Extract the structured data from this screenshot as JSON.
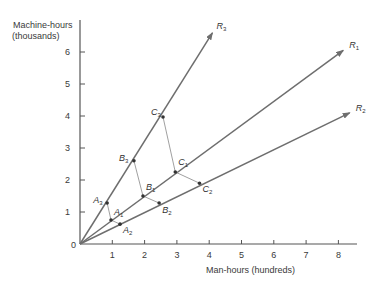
{
  "axes": {
    "y_label_line1": "Machine-hours",
    "y_label_line2": "(thousands)",
    "x_label": "Man-hours  (hundreds)",
    "x_ticks": [
      "1",
      "2",
      "3",
      "4",
      "5",
      "6",
      "7",
      "8"
    ],
    "y_ticks": [
      "1",
      "2",
      "3",
      "4",
      "5",
      "6"
    ],
    "origin": "0"
  },
  "rays": [
    {
      "name": "R",
      "sub": "3",
      "end": [
        4.1,
        6.6
      ]
    },
    {
      "name": "R",
      "sub": "1",
      "end": [
        8.15,
        6.05
      ]
    },
    {
      "name": "R",
      "sub": "2",
      "end": [
        8.35,
        4.1
      ]
    }
  ],
  "points": [
    {
      "name": "A",
      "sub": "3",
      "x": 0.84,
      "y": 1.28
    },
    {
      "name": "A",
      "sub": "1",
      "x": 0.96,
      "y": 0.75
    },
    {
      "name": "A",
      "sub": "2",
      "x": 1.24,
      "y": 0.62
    },
    {
      "name": "B",
      "sub": "3",
      "x": 1.67,
      "y": 2.6
    },
    {
      "name": "B",
      "sub": "1",
      "x": 1.95,
      "y": 1.5
    },
    {
      "name": "B",
      "sub": "2",
      "x": 2.45,
      "y": 1.28
    },
    {
      "name": "C",
      "sub": "3",
      "x": 2.57,
      "y": 3.97
    },
    {
      "name": "C",
      "sub": "1",
      "x": 2.95,
      "y": 2.25
    },
    {
      "name": "C",
      "sub": "2",
      "x": 3.7,
      "y": 1.9
    }
  ],
  "colors": {
    "line": "#6e6e6e",
    "text": "#333333",
    "axis": "#555555"
  }
}
